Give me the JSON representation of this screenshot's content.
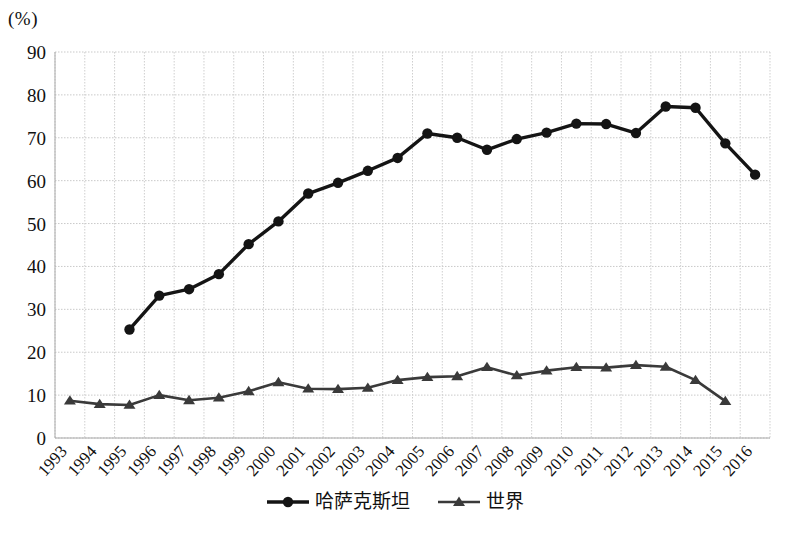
{
  "chart_data": {
    "type": "line",
    "title": "",
    "subtitle": "",
    "unit_label": "(%)",
    "xlabel": "",
    "ylabel": "",
    "ylim": [
      0,
      90
    ],
    "ytick_step": 10,
    "yticks": [
      "0",
      "10",
      "20",
      "30",
      "40",
      "50",
      "60",
      "70",
      "80",
      "90"
    ],
    "grid": true,
    "legend_position": "bottom-center",
    "categories": [
      "1993",
      "1994",
      "1995",
      "1996",
      "1997",
      "1998",
      "1999",
      "2000",
      "2001",
      "2002",
      "2003",
      "2004",
      "2005",
      "2006",
      "2007",
      "2008",
      "2009",
      "2010",
      "2011",
      "2012",
      "2013",
      "2014",
      "2015",
      "2016"
    ],
    "series": [
      {
        "name": "哈萨克斯坦",
        "marker": "circle",
        "color": "#141414",
        "values": [
          null,
          null,
          25.3,
          33.2,
          34.7,
          38.2,
          45.2,
          50.5,
          57.0,
          59.5,
          62.3,
          65.3,
          71.0,
          70.0,
          67.2,
          69.7,
          71.2,
          73.3,
          73.2,
          71.1,
          77.3,
          77.0,
          68.7,
          61.4
        ]
      },
      {
        "name": "世界",
        "marker": "triangle",
        "color": "#3a3a3a",
        "values": [
          8.7,
          7.9,
          7.7,
          10.0,
          8.8,
          9.4,
          10.9,
          13.0,
          11.5,
          11.4,
          11.7,
          13.5,
          14.2,
          14.4,
          16.5,
          14.6,
          15.7,
          16.5,
          16.4,
          17.0,
          16.6,
          13.5,
          8.6,
          null
        ]
      }
    ]
  },
  "legend": {
    "items": [
      {
        "label": "哈萨克斯坦",
        "marker": "circle"
      },
      {
        "label": "世界",
        "marker": "triangle"
      }
    ]
  }
}
